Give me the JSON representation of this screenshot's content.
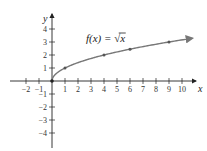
{
  "chart_data": {
    "type": "line",
    "title": "",
    "annotation": "f(x) = √x",
    "annotation_parts": {
      "lhs": "f(x) = ",
      "radical": "√",
      "radicand": "x"
    },
    "xlabel": "x",
    "ylabel": "y",
    "xlim": [
      -2.5,
      11
    ],
    "ylim": [
      -5,
      5
    ],
    "grid": false,
    "legend": null,
    "x_ticks": [
      -2,
      -1,
      1,
      2,
      3,
      4,
      5,
      6,
      7,
      8,
      9,
      10
    ],
    "y_ticks": [
      -4,
      -3,
      -2,
      -1,
      1,
      2,
      3,
      4
    ],
    "series": [
      {
        "name": "f(x) = sqrt(x)",
        "function": "sqrt",
        "domain": [
          0,
          10.8
        ],
        "arrow_end": true,
        "marked_points": [
          {
            "x": 0,
            "y": 0
          },
          {
            "x": 1,
            "y": 1
          },
          {
            "x": 4,
            "y": 2
          },
          {
            "x": 6,
            "y": 2.449
          },
          {
            "x": 9,
            "y": 3
          }
        ]
      }
    ],
    "colors": {
      "axis": "#222222",
      "curve": "#777777",
      "points": "#555555"
    }
  },
  "layout": {
    "origin_px": [
      52,
      81
    ],
    "unit_px": 13
  }
}
